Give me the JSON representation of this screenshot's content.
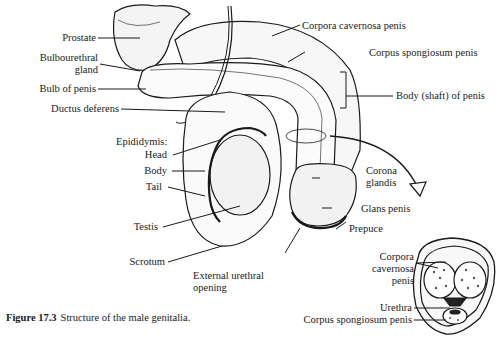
{
  "figure": {
    "number": "Figure 17.3",
    "caption": "Structure of the male genitalia."
  },
  "labels": {
    "prostate": "Prostate",
    "bulbourethral_1": "Bulbourethral",
    "bulbourethral_2": "gland",
    "bulb_of_penis": "Bulb of penis",
    "ductus_deferens": "Ductus deferens",
    "epididymis": "Epididymis:",
    "head": "Head",
    "body": "Body",
    "tail": "Tail",
    "testis": "Testis",
    "scrotum": "Scrotum",
    "external_urethral_1": "External urethral",
    "external_urethral_2": "opening",
    "corpora_cavernosa_penis": "Corpora cavernosa penis",
    "corpus_spongiosum_penis": "Corpus spongiosum penis",
    "body_shaft": "Body (shaft) of penis",
    "corona_1": "Corona",
    "corona_2": "glandis",
    "glans_penis": "Glans penis",
    "prepuce": "Prepuce",
    "xs_corpora_1": "Corpora",
    "xs_corpora_2": "cavernosa",
    "xs_corpora_3": "penis",
    "xs_urethra": "Urethra",
    "xs_corpus_spongiosum": "Corpus spongiosum penis"
  }
}
